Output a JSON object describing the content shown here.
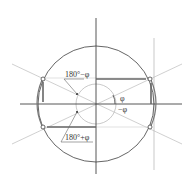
{
  "diagram": {
    "labels": {
      "upper_left_angle": "180°−φ",
      "lower_left_angle": "180°+φ",
      "phi": "φ",
      "neg_phi": "−φ"
    },
    "colors": {
      "axis": "#444444",
      "circle": "#555555",
      "light_line": "#bbbbbb",
      "arrow": "#888888"
    }
  }
}
